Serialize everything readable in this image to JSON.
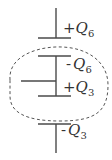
{
  "diagram": {
    "type": "capacitor-circuit",
    "labels": [
      {
        "sign": "+",
        "symbol": "Q",
        "subscript": "6"
      },
      {
        "sign": "-",
        "symbol": "Q",
        "subscript": "6"
      },
      {
        "sign": "+",
        "symbol": "Q",
        "subscript": "3"
      },
      {
        "sign": "-",
        "symbol": "Q",
        "subscript": "3"
      }
    ],
    "enclosure": "dashed-ellipse"
  }
}
